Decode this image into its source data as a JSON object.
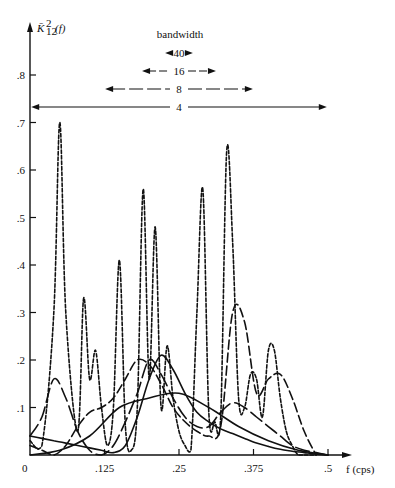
{
  "chart_data": {
    "type": "line",
    "title": "",
    "ylabel": "K̄²₁₂(f)",
    "xlabel": "f (cps)",
    "xlim": [
      0,
      0.5
    ],
    "ylim": [
      0,
      0.85
    ],
    "grid": false,
    "x_ticks": [
      "0",
      ".125",
      ".25",
      ".375",
      ".5"
    ],
    "y_ticks": [
      ".1",
      ".2",
      ".3",
      ".4",
      ".5",
      ".6",
      ".7",
      ".8"
    ],
    "legend": {
      "title": "bandwidth",
      "position": "top-center",
      "entries": [
        {
          "label": "40",
          "width_frac": 0.06
        },
        {
          "label": "16",
          "width_frac": 0.16
        },
        {
          "label": "8",
          "width_frac": 0.32
        },
        {
          "label": "4",
          "width_frac": 0.64
        }
      ]
    },
    "series": [
      {
        "name": "bandwidth 40",
        "style": "short-dash",
        "x": [
          0.0,
          0.02,
          0.04,
          0.05,
          0.06,
          0.08,
          0.09,
          0.1,
          0.11,
          0.12,
          0.13,
          0.14,
          0.15,
          0.16,
          0.17,
          0.18,
          0.19,
          0.2,
          0.21,
          0.22,
          0.23,
          0.24,
          0.25,
          0.26,
          0.27,
          0.28,
          0.29,
          0.3,
          0.31,
          0.32,
          0.33,
          0.34,
          0.35,
          0.36,
          0.37,
          0.38,
          0.39,
          0.4,
          0.41,
          0.42,
          0.43,
          0.44,
          0.45,
          0.46,
          0.47,
          0.48
        ],
        "y": [
          0.03,
          0.02,
          0.3,
          0.7,
          0.3,
          0.05,
          0.33,
          0.16,
          0.22,
          0.1,
          0.02,
          0.1,
          0.41,
          0.06,
          0.01,
          0.1,
          0.56,
          0.16,
          0.48,
          0.1,
          0.23,
          0.12,
          0.05,
          0.02,
          0.01,
          0.3,
          0.56,
          0.09,
          0.07,
          0.08,
          0.64,
          0.45,
          0.12,
          0.1,
          0.17,
          0.16,
          0.08,
          0.22,
          0.22,
          0.12,
          0.05,
          0.02,
          0.0,
          0.0,
          0.0,
          0.0
        ]
      },
      {
        "name": "bandwidth 16",
        "style": "long-dash",
        "x": [
          0.0,
          0.02,
          0.04,
          0.06,
          0.08,
          0.1,
          0.12,
          0.14,
          0.16,
          0.18,
          0.2,
          0.22,
          0.24,
          0.26,
          0.28,
          0.3,
          0.32,
          0.34,
          0.36,
          0.38,
          0.4,
          0.42,
          0.44,
          0.46,
          0.48
        ],
        "y": [
          0.02,
          0.01,
          0.0,
          0.02,
          0.06,
          0.09,
          0.1,
          0.12,
          0.16,
          0.2,
          0.19,
          0.15,
          0.1,
          0.07,
          0.05,
          0.04,
          0.06,
          0.3,
          0.28,
          0.13,
          0.16,
          0.17,
          0.12,
          0.05,
          0.0
        ]
      },
      {
        "name": "bandwidth 8",
        "style": "long-dash-sparse",
        "x": [
          0.0,
          0.02,
          0.04,
          0.06,
          0.08,
          0.1,
          0.12,
          0.14,
          0.16,
          0.18,
          0.2,
          0.22,
          0.24,
          0.26,
          0.28,
          0.3,
          0.32,
          0.34,
          0.36,
          0.38,
          0.4,
          0.42,
          0.44,
          0.46,
          0.48,
          0.5
        ],
        "y": [
          0.04,
          0.08,
          0.16,
          0.12,
          0.05,
          0.01,
          0.0,
          0.02,
          0.07,
          0.13,
          0.2,
          0.17,
          0.12,
          0.08,
          0.06,
          0.06,
          0.09,
          0.11,
          0.1,
          0.08,
          0.06,
          0.04,
          0.02,
          0.01,
          0.005,
          0.0
        ]
      },
      {
        "name": "bandwidth 4",
        "style": "solid",
        "x": [
          0.0,
          0.02,
          0.04,
          0.06,
          0.08,
          0.1,
          0.12,
          0.14,
          0.16,
          0.18,
          0.2,
          0.22,
          0.24,
          0.26,
          0.28,
          0.3,
          0.32,
          0.34,
          0.36,
          0.38,
          0.4,
          0.42,
          0.44,
          0.46,
          0.48,
          0.5
        ],
        "y": [
          0.04,
          0.035,
          0.03,
          0.025,
          0.02,
          0.015,
          0.01,
          0.005,
          0.02,
          0.08,
          0.16,
          0.21,
          0.18,
          0.13,
          0.09,
          0.07,
          0.055,
          0.045,
          0.035,
          0.025,
          0.018,
          0.012,
          0.008,
          0.005,
          0.002,
          0.0
        ]
      },
      {
        "name": "bandwidth 4 (broad)",
        "style": "solid-smooth",
        "x": [
          0.0,
          0.05,
          0.1,
          0.15,
          0.2,
          0.25,
          0.3,
          0.35,
          0.4,
          0.45,
          0.5
        ],
        "y": [
          0.0,
          0.01,
          0.04,
          0.1,
          0.12,
          0.13,
          0.1,
          0.06,
          0.03,
          0.01,
          0.0
        ]
      }
    ]
  },
  "axes": {
    "y_label_main": "K̄",
    "y_label_sup": "2",
    "y_label_sub": "12",
    "y_label_arg": "(f)",
    "x_label": "f (cps)",
    "origin_label": "0"
  }
}
